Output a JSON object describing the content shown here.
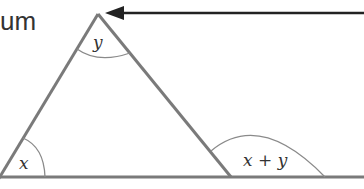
{
  "fragment_text": "um",
  "labels": {
    "apex_angle": "y",
    "left_angle": "x",
    "exterior_angle": "x + y"
  },
  "colors": {
    "triangle_stroke": "#7a7a7a",
    "arc_stroke": "#8a8a8a",
    "arrow": "#222222",
    "text": "#333333"
  }
}
